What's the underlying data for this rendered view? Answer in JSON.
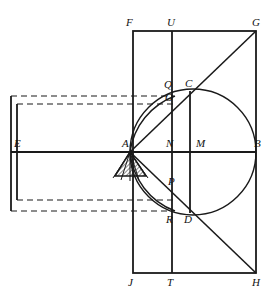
{
  "figure": {
    "width": 277,
    "height": 295,
    "background_color": "#ffffff",
    "stroke_color": "#1a1a1a",
    "dashed_color": "#1a1a1a"
  },
  "labels": {
    "F": "F",
    "U": "U",
    "G": "G",
    "Q": "Q",
    "O": "O",
    "C": "C",
    "E": "E",
    "A": "A",
    "N": "N",
    "M": "M",
    "B": "B",
    "P": "P",
    "R": "R",
    "D": "D",
    "J": "J",
    "T": "T",
    "H": "H"
  },
  "points": [
    {
      "id": "F",
      "name": "point-F",
      "label": "F",
      "x": 133,
      "y": 31,
      "label_x": 126,
      "label_y": 17
    },
    {
      "id": "U",
      "name": "point-U",
      "label": "U",
      "x": 172,
      "y": 31,
      "label_x": 167,
      "label_y": 17
    },
    {
      "id": "G",
      "name": "point-G",
      "label": "G",
      "x": 256,
      "y": 31,
      "label_x": 254,
      "label_y": 17
    },
    {
      "id": "Q",
      "name": "point-Q",
      "label": "Q",
      "x": 172,
      "y": 91,
      "label_x": 165,
      "label_y": 80
    },
    {
      "id": "O",
      "name": "point-O",
      "label": "O",
      "x": 174,
      "y": 103,
      "label_x": 167,
      "label_y": 92
    },
    {
      "id": "C",
      "name": "point-C",
      "label": "C",
      "x": 190,
      "y": 91,
      "label_x": 186,
      "label_y": 79
    },
    {
      "id": "E",
      "name": "point-E",
      "label": "E",
      "x": 11,
      "y": 152,
      "label_x": 15,
      "label_y": 138
    },
    {
      "id": "A",
      "name": "point-A",
      "label": "A",
      "x": 130,
      "y": 152,
      "label_x": 124,
      "label_y": 138
    },
    {
      "id": "N",
      "name": "point-N",
      "label": "N",
      "x": 172,
      "y": 152,
      "label_x": 167,
      "label_y": 138
    },
    {
      "id": "M",
      "name": "point-M",
      "label": "M",
      "x": 190,
      "y": 152,
      "label_x": 198,
      "label_y": 138
    },
    {
      "id": "B",
      "name": "point-B",
      "label": "B",
      "x": 256,
      "y": 152,
      "label_x": 256,
      "label_y": 138
    },
    {
      "id": "P",
      "name": "point-P",
      "label": "P",
      "x": 172,
      "y": 185,
      "label_x": 167,
      "label_y": 177
    },
    {
      "id": "R",
      "name": "point-R",
      "label": "R",
      "x": 172,
      "y": 213,
      "label_x": 167,
      "label_y": 214
    },
    {
      "id": "D",
      "name": "point-D",
      "label": "D",
      "x": 190,
      "y": 213,
      "label_x": 185,
      "label_y": 214
    },
    {
      "id": "J",
      "name": "point-J",
      "label": "J",
      "x": 133,
      "y": 273,
      "label_x": 128,
      "label_y": 278
    },
    {
      "id": "T",
      "name": "point-T",
      "label": "T",
      "x": 172,
      "y": 273,
      "label_x": 167,
      "label_y": 278
    },
    {
      "id": "H",
      "name": "point-H",
      "label": "H",
      "x": 256,
      "y": 273,
      "label_x": 253,
      "label_y": 278
    }
  ],
  "geometry": {
    "outer_rectangle": {
      "x": 133,
      "y": 31,
      "width": 123,
      "height": 242
    },
    "vertical_line_UT": {
      "x": 172,
      "y1": 31,
      "y2": 273
    },
    "vertical_line_CD": {
      "x": 190,
      "y1": 91,
      "y2": 213
    },
    "horizontal_line_EB": {
      "x1": 11,
      "x2": 256,
      "y": 152
    },
    "circle": {
      "cx": 193,
      "cy": 152,
      "r": 63
    },
    "diagonal_AG": {
      "x1": 130,
      "y1": 152,
      "x2": 256,
      "y2": 31
    },
    "diagonal_AH": {
      "x1": 130,
      "y1": 152,
      "x2": 256,
      "y2": 273
    },
    "chord_AC": {
      "x1": 130,
      "y1": 152,
      "x2": 190,
      "y2": 91
    },
    "chord_AD": {
      "x1": 130,
      "y1": 152,
      "x2": 190,
      "y2": 213
    },
    "arc_AQ": {
      "from_x": 130,
      "from_y": 152,
      "to_x": 174,
      "to_y": 97,
      "r": 72
    },
    "arc_AR": {
      "from_x": 130,
      "from_y": 152,
      "to_x": 174,
      "to_y": 211,
      "r": 72
    },
    "dashed_outer_rect": {
      "x": 11,
      "y": 96,
      "x2": 174,
      "y2": 211
    },
    "dashed_inner_rect": {
      "x": 17,
      "y": 104,
      "x2": 174,
      "y2": 200
    },
    "solid_left_outer": {
      "x": 11,
      "y1": 96,
      "y2": 211
    },
    "solid_left_inner": {
      "x": 17,
      "y1": 104,
      "y2": 200
    },
    "shaded_triangle": {
      "apex_x": 130,
      "apex_y": 152,
      "left_x": 115,
      "right_x": 145,
      "base_y": 175
    },
    "fan_lines_from_A": [
      {
        "x2": 115,
        "y2": 175
      },
      {
        "x2": 122,
        "y2": 177
      },
      {
        "x2": 130,
        "y2": 178
      },
      {
        "x2": 138,
        "y2": 177
      },
      {
        "x2": 145,
        "y2": 175
      }
    ]
  }
}
